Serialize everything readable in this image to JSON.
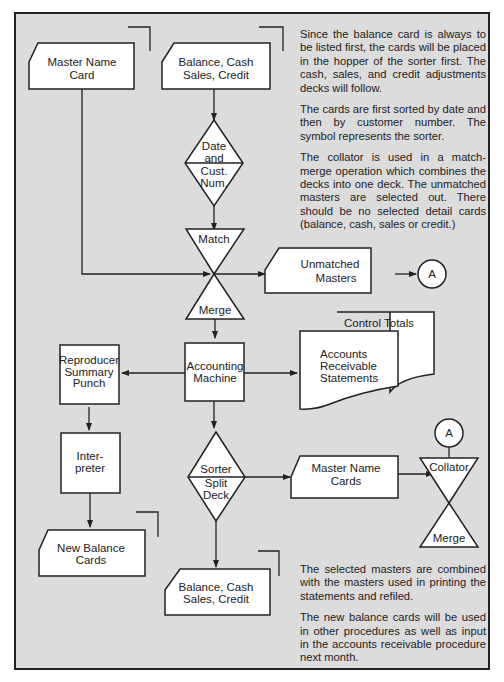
{
  "colors": {
    "page_background": "#ffffff",
    "panel_background": "#dcdcdc",
    "shape_fill": "#ffffff",
    "stroke": "#222222",
    "text": "#222222"
  },
  "nodes": {
    "master_name_card": {
      "line1": "Master Name",
      "line2": "Card"
    },
    "balance_cash_top": {
      "line1": "Balance, Cash",
      "line2": "Sales, Credit"
    },
    "sort_date": {
      "line1": "Date",
      "line2": "and",
      "line3": "Cust.",
      "line4": "Num."
    },
    "match": {
      "label": "Match"
    },
    "merge_top": {
      "label": "Merge"
    },
    "unmatched_masters": {
      "line1": "Unmatched",
      "line2": "Masters"
    },
    "connector_a_out": {
      "label": "A"
    },
    "accounting_machine": {
      "line1": "Accounting",
      "line2": "Machine"
    },
    "reproducer": {
      "line1": "Reproducer",
      "line2": "Summary",
      "line3": "Punch"
    },
    "control_totals": {
      "label": "Control Totals"
    },
    "ar_statements": {
      "line1": "Accounts",
      "line2": "Receivable",
      "line3": "Statements"
    },
    "interpreter": {
      "line1": "Inter-",
      "line2": "preter"
    },
    "sorter_split": {
      "line1": "Sorter",
      "line2": "Split",
      "line3": "Deck"
    },
    "master_name_cards": {
      "line1": "Master Name",
      "line2": "Cards"
    },
    "connector_a_in": {
      "label": "A"
    },
    "collator": {
      "label": "Collator"
    },
    "merge_bottom": {
      "label": "Merge"
    },
    "new_balance_cards": {
      "line1": "New Balance",
      "line2": "Cards"
    },
    "balance_cash_bottom": {
      "line1": "Balance, Cash",
      "line2": "Sales, Credit"
    }
  },
  "notes": {
    "top": [
      "Since the balance card is always to be listed first, the cards will be placed in the hopper of the sorter first.  The cash, sales, and credit adjustments decks will follow.",
      "The cards are first sorted by date and then by customer number.  The symbol represents the sorter.",
      "The collator is used in a match-merge operation which combines the decks into one deck.  The unmatched masters are selected out. There should be no selected detail cards (balance, cash, sales or credit.)"
    ],
    "bottom": [
      "The selected masters are combined with the masters used in printing the statements and refiled.",
      "The new balance cards will be used in other procedures as well as input in the accounts receivable procedure next month."
    ]
  }
}
